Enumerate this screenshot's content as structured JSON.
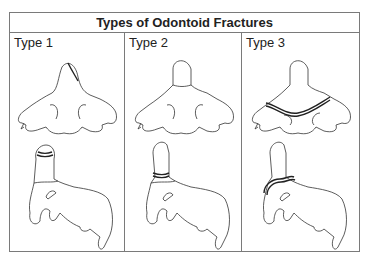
{
  "figure": {
    "title": "Types of Odontoid Fractures",
    "panels": [
      {
        "label": "Type 1",
        "fracture_location": "tip of dens"
      },
      {
        "label": "Type 2",
        "fracture_location": "base of dens"
      },
      {
        "label": "Type 3",
        "fracture_location": "extends into vertebral body"
      }
    ]
  },
  "colors": {
    "border": "#7a7a7a",
    "line": "#333333",
    "background": "#ffffff"
  }
}
